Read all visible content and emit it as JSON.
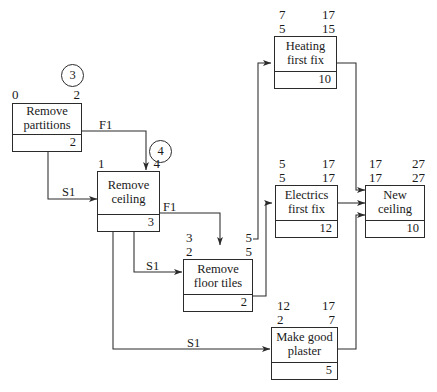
{
  "diagram": {
    "type": "precedence-network",
    "stroke_color": "#2b2b2b",
    "background_color": "#ffffff"
  },
  "nodes": [
    {
      "id": "remove-partitions",
      "name_line1": "Remove",
      "name_line2": "partitions",
      "duration": "2",
      "early_start": "0",
      "early_finish": "2",
      "late_start": "",
      "late_finish": "",
      "float": "3"
    },
    {
      "id": "remove-ceiling",
      "name_line1": "Remove",
      "name_line2": "ceiling",
      "duration": "3",
      "early_start": "1",
      "early_finish": "4",
      "late_start": "",
      "late_finish": "",
      "float": "4"
    },
    {
      "id": "remove-floor-tiles",
      "name_line1": "Remove",
      "name_line2": "floor tiles",
      "duration": "2",
      "early_start": "3",
      "early_finish": "5",
      "late_start": "2",
      "late_finish": "5",
      "float": ""
    },
    {
      "id": "heating-first-fix",
      "name_line1": "Heating",
      "name_line2": "first fix",
      "duration": "10",
      "early_start": "7",
      "early_finish": "17",
      "late_start": "5",
      "late_finish": "15",
      "float": ""
    },
    {
      "id": "electrics-first-fix",
      "name_line1": "Electrics",
      "name_line2": "first fix",
      "duration": "12",
      "early_start": "5",
      "early_finish": "17",
      "late_start": "5",
      "late_finish": "17",
      "float": ""
    },
    {
      "id": "new-ceiling",
      "name_line1": "New",
      "name_line2": "ceiling",
      "duration": "10",
      "early_start": "17",
      "early_finish": "27",
      "late_start": "17",
      "late_finish": "27",
      "float": ""
    },
    {
      "id": "make-good-plaster",
      "name_line1": "Make good",
      "name_line2": "plaster",
      "duration": "5",
      "early_start": "12",
      "early_finish": "17",
      "late_start": "2",
      "late_finish": "7",
      "float": ""
    }
  ],
  "links": [
    {
      "id": "partitions-to-ceiling-finish",
      "label": "F1",
      "from": "remove-partitions",
      "to": "remove-ceiling"
    },
    {
      "id": "partitions-to-ceiling-start",
      "label": "S1",
      "from": "remove-partitions",
      "to": "remove-ceiling"
    },
    {
      "id": "ceiling-to-floor-tiles-finish",
      "label": "F1",
      "from": "remove-ceiling",
      "to": "remove-floor-tiles"
    },
    {
      "id": "ceiling-to-floor-tiles-start",
      "label": "S1",
      "from": "remove-ceiling",
      "to": "remove-floor-tiles"
    },
    {
      "id": "ceiling-to-plaster-start",
      "label": "S1",
      "from": "remove-ceiling",
      "to": "make-good-plaster"
    },
    {
      "id": "floor-tiles-to-heating",
      "label": "",
      "from": "remove-floor-tiles",
      "to": "heating-first-fix"
    },
    {
      "id": "floor-tiles-to-electrics",
      "label": "",
      "from": "remove-floor-tiles",
      "to": "electrics-first-fix"
    },
    {
      "id": "heating-to-new-ceiling",
      "label": "",
      "from": "heating-first-fix",
      "to": "new-ceiling"
    },
    {
      "id": "electrics-to-new-ceiling",
      "label": "",
      "from": "electrics-first-fix",
      "to": "new-ceiling"
    },
    {
      "id": "plaster-to-new-ceiling",
      "label": "",
      "from": "make-good-plaster",
      "to": "new-ceiling"
    }
  ]
}
